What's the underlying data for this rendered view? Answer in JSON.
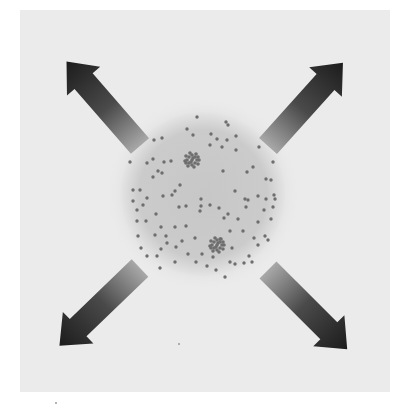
{
  "diagram": {
    "colors": {
      "page_background": "#ffffff",
      "panel_background": "#ebebeb",
      "circle_fill": "#c9c9c9",
      "circle_edge": "#e2e2e2",
      "particle": "#6e6e6e",
      "arrow_dark": "#1e1e1e",
      "arrow_light": "#9a9a9a"
    },
    "circle": {
      "cx": 203,
      "cy": 194,
      "r": 82
    },
    "arrows": [
      {
        "id": "up-left",
        "direction": "north-west",
        "tail": [
          140,
          146
        ],
        "tip": [
          64,
          60
        ]
      },
      {
        "id": "up-right",
        "direction": "north-east",
        "tail": [
          268,
          146
        ],
        "tip": [
          340,
          64
        ]
      },
      {
        "id": "down-left",
        "direction": "south-west",
        "tail": [
          140,
          268
        ],
        "tip": [
          66,
          340
        ]
      },
      {
        "id": "down-right",
        "direction": "south-east",
        "tail": [
          268,
          270
        ],
        "tip": [
          338,
          340
        ]
      }
    ],
    "clusters": [
      {
        "id": "cluster-upper",
        "cx": 192,
        "cy": 160,
        "r": 9
      },
      {
        "id": "cluster-lower",
        "cx": 217,
        "cy": 245,
        "r": 9
      }
    ],
    "particles": [
      [
        197,
        117
      ],
      [
        226,
        122
      ],
      [
        228,
        125
      ],
      [
        154,
        140
      ],
      [
        162,
        138
      ],
      [
        193,
        135
      ],
      [
        187,
        129
      ],
      [
        211,
        134
      ],
      [
        210,
        145
      ],
      [
        227,
        140
      ],
      [
        217,
        139
      ],
      [
        236,
        136
      ],
      [
        259,
        147
      ],
      [
        222,
        147
      ],
      [
        236,
        150
      ],
      [
        273,
        162
      ],
      [
        153,
        159
      ],
      [
        164,
        162
      ],
      [
        171,
        161
      ],
      [
        147,
        163
      ],
      [
        130,
        162
      ],
      [
        158,
        171
      ],
      [
        162,
        173
      ],
      [
        153,
        177
      ],
      [
        180,
        185
      ],
      [
        223,
        171
      ],
      [
        253,
        167
      ],
      [
        247,
        172
      ],
      [
        271,
        180
      ],
      [
        266,
        179
      ],
      [
        140,
        190
      ],
      [
        175,
        191
      ],
      [
        186,
        206
      ],
      [
        172,
        195
      ],
      [
        235,
        191
      ],
      [
        245,
        199
      ],
      [
        258,
        196
      ],
      [
        248,
        200
      ],
      [
        266,
        199
      ],
      [
        274,
        195
      ],
      [
        133,
        190
      ],
      [
        133,
        201
      ],
      [
        147,
        198
      ],
      [
        163,
        196
      ],
      [
        143,
        205
      ],
      [
        137,
        210
      ],
      [
        156,
        214
      ],
      [
        201,
        199
      ],
      [
        201,
        206
      ],
      [
        210,
        205
      ],
      [
        200,
        211
      ],
      [
        219,
        208
      ],
      [
        228,
        214
      ],
      [
        246,
        207
      ],
      [
        264,
        210
      ],
      [
        275,
        199
      ],
      [
        273,
        207
      ],
      [
        179,
        207
      ],
      [
        137,
        221
      ],
      [
        146,
        221
      ],
      [
        161,
        227
      ],
      [
        175,
        227
      ],
      [
        186,
        226
      ],
      [
        224,
        218
      ],
      [
        238,
        219
      ],
      [
        258,
        222
      ],
      [
        271,
        219
      ],
      [
        230,
        231
      ],
      [
        243,
        231
      ],
      [
        155,
        235
      ],
      [
        166,
        236
      ],
      [
        167,
        243
      ],
      [
        182,
        241
      ],
      [
        195,
        238
      ],
      [
        220,
        239
      ],
      [
        254,
        238
      ],
      [
        265,
        236
      ],
      [
        161,
        249
      ],
      [
        176,
        247
      ],
      [
        157,
        256
      ],
      [
        188,
        254
      ],
      [
        202,
        254
      ],
      [
        213,
        257
      ],
      [
        232,
        248
      ],
      [
        258,
        245
      ],
      [
        141,
        248
      ],
      [
        249,
        256
      ],
      [
        196,
        262
      ],
      [
        175,
        262
      ],
      [
        207,
        266
      ],
      [
        235,
        264
      ],
      [
        160,
        268
      ],
      [
        216,
        270
      ],
      [
        225,
        277
      ],
      [
        244,
        263
      ],
      [
        252,
        262
      ],
      [
        230,
        262
      ],
      [
        147,
        256
      ],
      [
        268,
        240
      ],
      [
        138,
        236
      ]
    ],
    "stray_marks": [
      [
        178,
        343
      ],
      [
        55,
        402
      ]
    ]
  }
}
